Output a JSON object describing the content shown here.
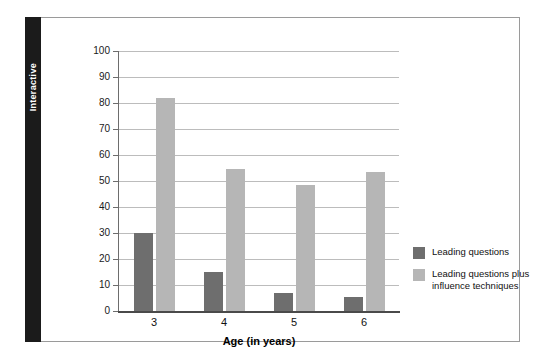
{
  "side_tab": {
    "label": "Interactive"
  },
  "chart_data": {
    "type": "bar",
    "title": "",
    "xlabel": "Age (in years)",
    "ylabel": "Mean percent yes answers to misleading questions",
    "categories": [
      "3",
      "4",
      "5",
      "6"
    ],
    "ylim": [
      0,
      100
    ],
    "yticks": [
      0,
      10,
      20,
      30,
      40,
      50,
      60,
      70,
      80,
      90,
      100
    ],
    "ytick_labels": [
      "0",
      "10",
      "20",
      "30",
      "40",
      "50",
      "60",
      "70",
      "80",
      "90",
      "100"
    ],
    "grid": true,
    "legend_position": "right",
    "series": [
      {
        "name": "Leading questions",
        "color": "#6e6e6e",
        "values": [
          30,
          15,
          7,
          5.5
        ]
      },
      {
        "name": "Leading questions plus influence techniques",
        "color": "#b6b6b6",
        "values": [
          82,
          54.5,
          48.5,
          53.5
        ]
      }
    ]
  },
  "legend": {
    "items": [
      {
        "label": "Leading questions",
        "color": "#6e6e6e"
      },
      {
        "label": "Leading questions plus influence techniques",
        "color": "#b6b6b6"
      }
    ]
  }
}
